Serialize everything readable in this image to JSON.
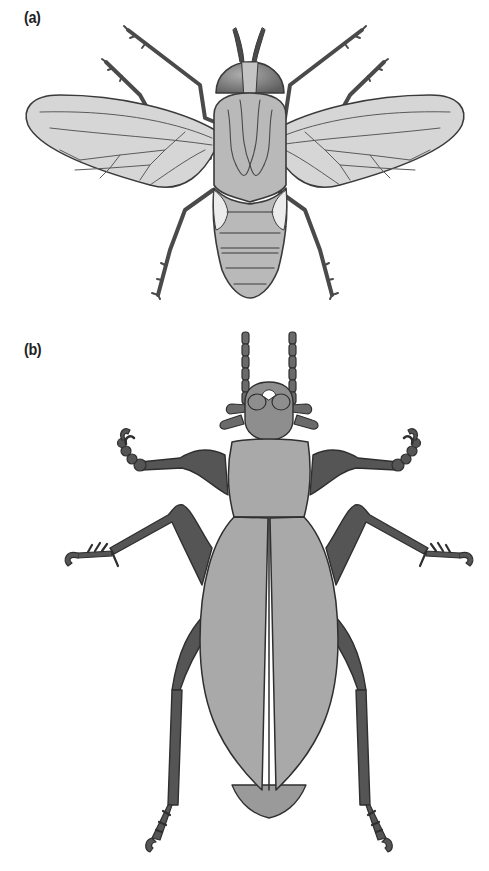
{
  "figure": {
    "panels": [
      {
        "label": "(a)",
        "subject": "fly",
        "view": "dorsal"
      },
      {
        "label": "(b)",
        "subject": "beetle",
        "view": "dorsal"
      }
    ]
  },
  "colors": {
    "background": "#ffffff",
    "outline": "#3a3a3a",
    "fly_body": "#b9b9b9",
    "fly_wing": "#d6d6d6",
    "fly_eye": "#7a7a7a",
    "fly_leg": "#4a4a4a",
    "fly_halter_patch": "#ececec",
    "beetle_elytra": "#a9a9a9",
    "beetle_leg": "#555555",
    "beetle_head": "#8e8e8e",
    "beetle_abdomen_tip": "#9a9a9a"
  }
}
